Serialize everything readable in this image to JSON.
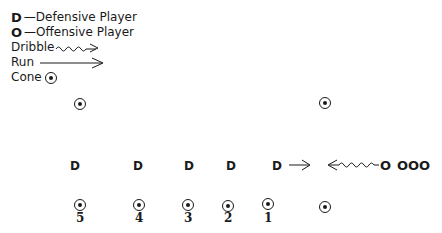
{
  "legend": {
    "defensive": {
      "symbol": "D",
      "label": "—Defensive Player"
    },
    "offensive": {
      "symbol": "O",
      "label": "—Offensive Player"
    },
    "dribble": {
      "label": "Dribble",
      "icon": "wavy-arrow-icon"
    },
    "run": {
      "label": "Run",
      "icon": "straight-arrow-icon"
    },
    "cone": {
      "label": "Cone",
      "icon": "cone-icon"
    }
  },
  "diagram": {
    "defenders": [
      "D",
      "D",
      "D",
      "D",
      "D"
    ],
    "offense": {
      "dribbler": "O",
      "waiting": "OOO"
    },
    "cone_numbers": [
      "5",
      "4",
      "3",
      "2",
      "1"
    ],
    "ink_color": "#1a1a1a"
  }
}
